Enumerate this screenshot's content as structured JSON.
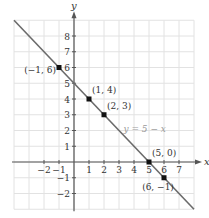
{
  "chart_data": {
    "type": "line",
    "title": "",
    "xlabel": "x",
    "ylabel": "y",
    "xlim": [
      -4,
      8
    ],
    "ylim": [
      -3,
      9
    ],
    "grid": true,
    "x_ticks": [
      -2,
      -1,
      1,
      2,
      3,
      4,
      5,
      6,
      7
    ],
    "y_ticks": [
      -2,
      -1,
      1,
      2,
      3,
      4,
      5,
      6,
      7,
      8
    ],
    "x_tick_labels": [
      "−2",
      "−1",
      "1",
      "2",
      "3",
      "4",
      "5",
      "6",
      "7"
    ],
    "y_tick_labels": [
      "−2",
      "−1",
      "1",
      "2",
      "3",
      "4",
      "5",
      "6",
      "7",
      "8"
    ],
    "series": [
      {
        "name": "y = 5 − x",
        "equation": "y = 5 - x",
        "x": [
          -4,
          8
        ],
        "y": [
          9,
          -3
        ]
      }
    ],
    "points": [
      {
        "x": -1,
        "y": 6,
        "label": "(−1, 6)"
      },
      {
        "x": 1,
        "y": 4,
        "label": "(1, 4)"
      },
      {
        "x": 2,
        "y": 3,
        "label": "(2, 3)"
      },
      {
        "x": 5,
        "y": 0,
        "label": "(5, 0)"
      },
      {
        "x": 6,
        "y": -1,
        "label": "(6, −1)"
      }
    ],
    "annotations": [
      {
        "text": "y = 5 − x",
        "x": 3.3,
        "y": 1.9
      }
    ],
    "colors": {
      "line": "#6b6b6b",
      "grid": "#e2e2e2",
      "axis": "#555555",
      "point": "#111111",
      "text": "#333333",
      "equation_label": "#9a9a9a"
    }
  },
  "axis_labels": {
    "x": "x",
    "y": "y"
  },
  "equation_label": "y = 5 − x"
}
